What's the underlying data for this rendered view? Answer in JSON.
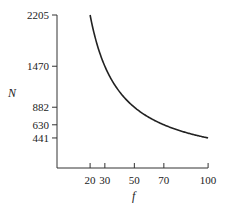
{
  "chart_data": {
    "type": "line",
    "title": "",
    "xlabel": "f",
    "ylabel": "N",
    "x_ticks": [
      20,
      30,
      50,
      70,
      100
    ],
    "y_ticks": [
      441,
      630,
      882,
      1470,
      2205
    ],
    "xlim": [
      0,
      100
    ],
    "ylim": [
      0,
      2205
    ],
    "grid": false,
    "legend": null,
    "relation": "N = 44100 / f",
    "series": [
      {
        "name": "N",
        "x": [
          20,
          25,
          30,
          35,
          40,
          45,
          50,
          55,
          60,
          65,
          70,
          75,
          80,
          85,
          90,
          95,
          100
        ],
        "y": [
          2205,
          1764,
          1470,
          1260,
          1102.5,
          980,
          882,
          801.8,
          735,
          678.5,
          630,
          588,
          551.3,
          518.8,
          490,
          464.2,
          441
        ]
      }
    ],
    "color": "#222222"
  }
}
